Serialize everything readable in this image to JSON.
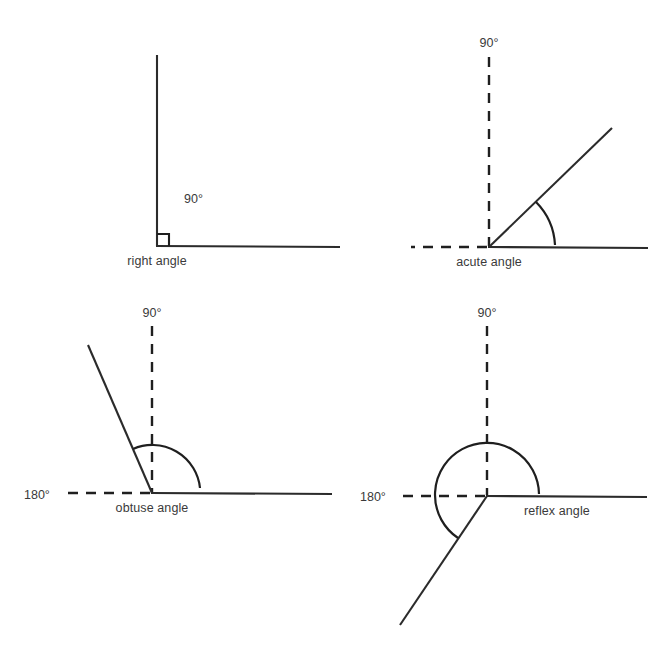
{
  "figure": {
    "background_color": "#ffffff",
    "line_color": "#2b2b2b",
    "text_color": "#3a3a3a"
  },
  "panels": [
    {
      "id": "right-angle",
      "name": "right angle",
      "caption": "right angle",
      "degree_labels": [
        "90°"
      ],
      "vertex": {
        "x": 157,
        "y": 246
      },
      "reference_marks": [
        "right-angle-square"
      ],
      "rays": [
        {
          "id": "vertical-arm",
          "style": "solid",
          "angle_deg": 90,
          "length": 191
        },
        {
          "id": "horizontal-arm",
          "style": "solid",
          "angle_deg": 0,
          "length": 183
        }
      ],
      "measured_angle_deg": 90,
      "label_positions": {
        "degree": {
          "x": 184,
          "y": 203
        },
        "caption": {
          "x": 157,
          "y": 262
        }
      }
    },
    {
      "id": "acute-angle",
      "name": "acute angle",
      "caption": "acute angle",
      "degree_labels": [
        "90°"
      ],
      "vertex": {
        "x": 489,
        "y": 247
      },
      "reference_marks": [
        "dashed-vertical-90",
        "dashed-horizontal-left"
      ],
      "rays": [
        {
          "id": "vertical-reference",
          "style": "dashed",
          "angle_deg": 90,
          "length": 190
        },
        {
          "id": "horizontal-left-reference",
          "style": "dashed",
          "angle_deg": 180,
          "length": 78
        },
        {
          "id": "horizontal-arm",
          "style": "solid",
          "angle_deg": 0,
          "length": 160
        },
        {
          "id": "angle-arm",
          "style": "solid",
          "angle_deg": 44,
          "length": 171
        }
      ],
      "measured_angle_deg": 44,
      "arc": {
        "radius": 66,
        "start_deg": 0,
        "end_deg": 44
      },
      "label_positions": {
        "degree": {
          "x": 489,
          "y": 46
        },
        "caption": {
          "x": 489,
          "y": 263
        }
      }
    },
    {
      "id": "obtuse-angle",
      "name": "obtuse angle",
      "caption": "obtuse angle",
      "degree_labels": [
        "90°",
        "180°"
      ],
      "vertex": {
        "x": 152,
        "y": 493
      },
      "reference_marks": [
        "dashed-vertical-90",
        "dashed-horizontal-180"
      ],
      "rays": [
        {
          "id": "vertical-reference",
          "style": "dashed",
          "angle_deg": 90,
          "length": 169
        },
        {
          "id": "horizontal-left-reference",
          "style": "dashed",
          "angle_deg": 180,
          "length": 86
        },
        {
          "id": "horizontal-arm",
          "style": "solid",
          "angle_deg": 0,
          "length": 180
        },
        {
          "id": "angle-arm",
          "style": "solid",
          "angle_deg": 113,
          "length": 161
        }
      ],
      "measured_angle_deg": 113,
      "arc": {
        "radius": 48,
        "start_deg": 6,
        "end_deg": 113
      },
      "label_positions": {
        "degree_90": {
          "x": 152,
          "y": 316
        },
        "degree_180": {
          "x": 24,
          "y": 498
        },
        "caption": {
          "x": 152,
          "y": 509
        }
      }
    },
    {
      "id": "reflex-angle",
      "name": "reflex angle",
      "caption": "reflex angle",
      "degree_labels": [
        "90°",
        "180°"
      ],
      "vertex": {
        "x": 487,
        "y": 496
      },
      "reference_marks": [
        "dashed-vertical-90",
        "dashed-horizontal-180"
      ],
      "rays": [
        {
          "id": "vertical-reference",
          "style": "dashed",
          "angle_deg": 90,
          "length": 172
        },
        {
          "id": "horizontal-left-reference",
          "style": "dashed",
          "angle_deg": 180,
          "length": 86
        },
        {
          "id": "horizontal-arm",
          "style": "solid",
          "angle_deg": 0,
          "length": 160
        },
        {
          "id": "angle-arm",
          "style": "solid",
          "angle_deg": 214,
          "length": 156
        }
      ],
      "measured_angle_deg": 214,
      "arc": {
        "radius": 52,
        "start_deg": 0,
        "end_deg": 214
      },
      "label_positions": {
        "degree_90": {
          "x": 487,
          "y": 316
        },
        "degree_180": {
          "x": 360,
          "y": 500
        },
        "caption": {
          "x": 524,
          "y": 512
        }
      }
    }
  ],
  "labels": {
    "deg90": "90°",
    "deg180": "180°",
    "right_angle": "right angle",
    "acute_angle": "acute angle",
    "obtuse_angle": "obtuse angle",
    "reflex_angle": "reflex angle"
  }
}
